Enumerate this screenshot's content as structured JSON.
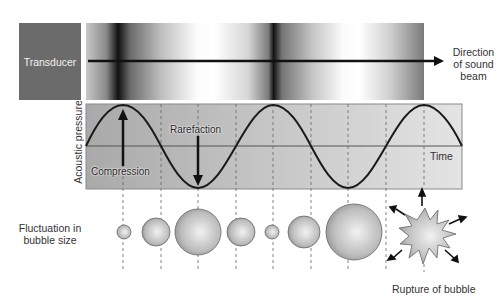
{
  "labels": {
    "transducer": "Transducer",
    "direction_line1": "Direction",
    "direction_line2": "of sound",
    "direction_line3": "beam",
    "y_axis": "Acoustic pressure",
    "time": "Time",
    "compression": "Compression",
    "rarefaction": "Rarefaction",
    "fluctuation_line1": "Fluctuation in",
    "fluctuation_line2": "bubble size",
    "rupture": "Rupture of bubble"
  },
  "colors": {
    "transducer_bg": "#6b6b6b",
    "wave_panel_bg": "#b9b9b9",
    "wave_line": "#1a1a1a",
    "bubble_fill": "#b5b5b5"
  },
  "wave": {
    "period_px": 150,
    "first_peak_x": 123,
    "dashed_line_x": [
      123,
      161,
      198,
      236,
      273,
      311,
      348,
      386,
      424
    ]
  },
  "bubbles": [
    {
      "x": 124,
      "r": 7
    },
    {
      "x": 156,
      "r": 14
    },
    {
      "x": 198,
      "r": 23
    },
    {
      "x": 241,
      "r": 14
    },
    {
      "x": 272,
      "r": 7
    },
    {
      "x": 304,
      "r": 16
    },
    {
      "x": 354,
      "r": 28
    }
  ]
}
